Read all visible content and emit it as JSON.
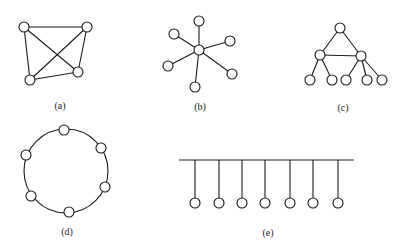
{
  "figure": {
    "panels": [
      {
        "id": "a",
        "label": "(a)",
        "kind": "fully-connected mesh",
        "nodes": [
          [
            24,
            27
          ],
          [
            87,
            27
          ],
          [
            78,
            72
          ],
          [
            30,
            80
          ]
        ],
        "edges": [
          [
            0,
            1
          ],
          [
            0,
            3
          ],
          [
            1,
            2
          ],
          [
            3,
            2
          ],
          [
            0,
            2
          ],
          [
            1,
            3
          ]
        ],
        "label_pos": [
          60,
          109
        ]
      },
      {
        "id": "b",
        "label": "(b)",
        "kind": "star",
        "center": [
          199,
          50
        ],
        "nodes": [
          [
            199,
            21
          ],
          [
            174,
            34
          ],
          [
            230,
            41
          ],
          [
            168,
            66
          ],
          [
            232,
            74
          ],
          [
            195,
            87
          ]
        ],
        "label_pos": [
          200,
          110
        ]
      },
      {
        "id": "c",
        "label": "(c)",
        "kind": "tree",
        "nodes": [
          [
            340,
            28
          ],
          [
            320,
            55
          ],
          [
            361,
            56
          ],
          [
            310,
            80
          ],
          [
            332,
            80
          ],
          [
            346,
            80
          ],
          [
            367,
            80
          ],
          [
            382,
            80
          ]
        ],
        "edges": [
          [
            0,
            1
          ],
          [
            0,
            2
          ],
          [
            1,
            2
          ],
          [
            1,
            3
          ],
          [
            1,
            4
          ],
          [
            2,
            5
          ],
          [
            2,
            6
          ],
          [
            2,
            7
          ]
        ],
        "label_pos": [
          343,
          111
        ]
      },
      {
        "id": "d",
        "label": "(d)",
        "kind": "ring",
        "center": [
          66,
          171
        ],
        "radius": 42,
        "nodes": [
          [
            64,
            130
          ],
          [
            101,
            148
          ],
          [
            105,
            187
          ],
          [
            69,
            212
          ],
          [
            31,
            196
          ],
          [
            26,
            155
          ]
        ],
        "label_pos": [
          67,
          235
        ]
      },
      {
        "id": "e",
        "label": "(e)",
        "kind": "bus",
        "bus": {
          "x1": 179,
          "x2": 354,
          "y": 160
        },
        "drops_x": [
          195,
          219,
          242,
          265,
          290,
          313,
          338
        ],
        "node_y": 203,
        "label_pos": [
          268,
          236
        ]
      }
    ],
    "node_radius": 5,
    "stroke_color": "#1a1a1a"
  }
}
